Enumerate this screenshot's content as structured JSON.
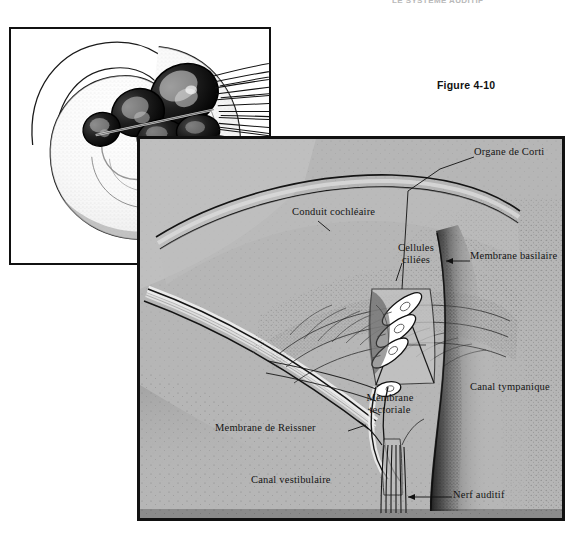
{
  "page": {
    "running_head": "LE SYSTÈME AUDITIF",
    "background_color": "#ffffff"
  },
  "figure": {
    "number_label": "Figure 4-10",
    "panel_fill_color": "#b6b6b6",
    "border_color": "#111111"
  },
  "inset": {
    "name": "cochlea-spiral-inset",
    "description": "Coupe en spirale de la cochlée avec fibres nerveuses"
  },
  "labels": {
    "organe_de_corti": "Organe de Corti",
    "conduit_cochleaire": "Conduit cochléaire",
    "cellules_ciliees_line1": "Cellules",
    "cellules_ciliees_line2": "ciliées",
    "membrane_basilaire": "Membrane basilaire",
    "canal_tympanique": "Canal tympanique",
    "membrane_tectoriale_line1": "Membrane",
    "membrane_tectoriale_line2": "tectoriale",
    "membrane_de_reissner": "Membrane de Reissner",
    "canal_vestibulaire": "Canal vestibulaire",
    "nerf_auditif": "Nerf auditif"
  }
}
